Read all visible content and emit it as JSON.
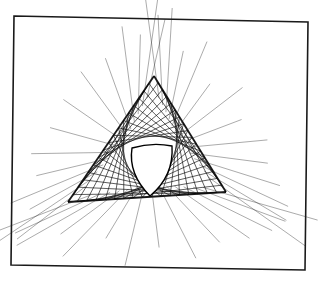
{
  "figure": {
    "frame": {
      "corners": [
        [
          14,
          16
        ],
        [
          308,
          22
        ],
        [
          305,
          270
        ],
        [
          11,
          265
        ]
      ],
      "stroke": "#1a1a1a",
      "stroke_width": 1.6
    },
    "triangle": {
      "vertices": [
        [
          154,
          76
        ],
        [
          68,
          202
        ],
        [
          226,
          192
        ]
      ],
      "line_color": "#111111"
    },
    "hole_center": [
      152,
      168
    ],
    "rays": {
      "count_per_vertex": 14,
      "length": 70,
      "color": "#222222"
    },
    "background": "#ffffff"
  }
}
